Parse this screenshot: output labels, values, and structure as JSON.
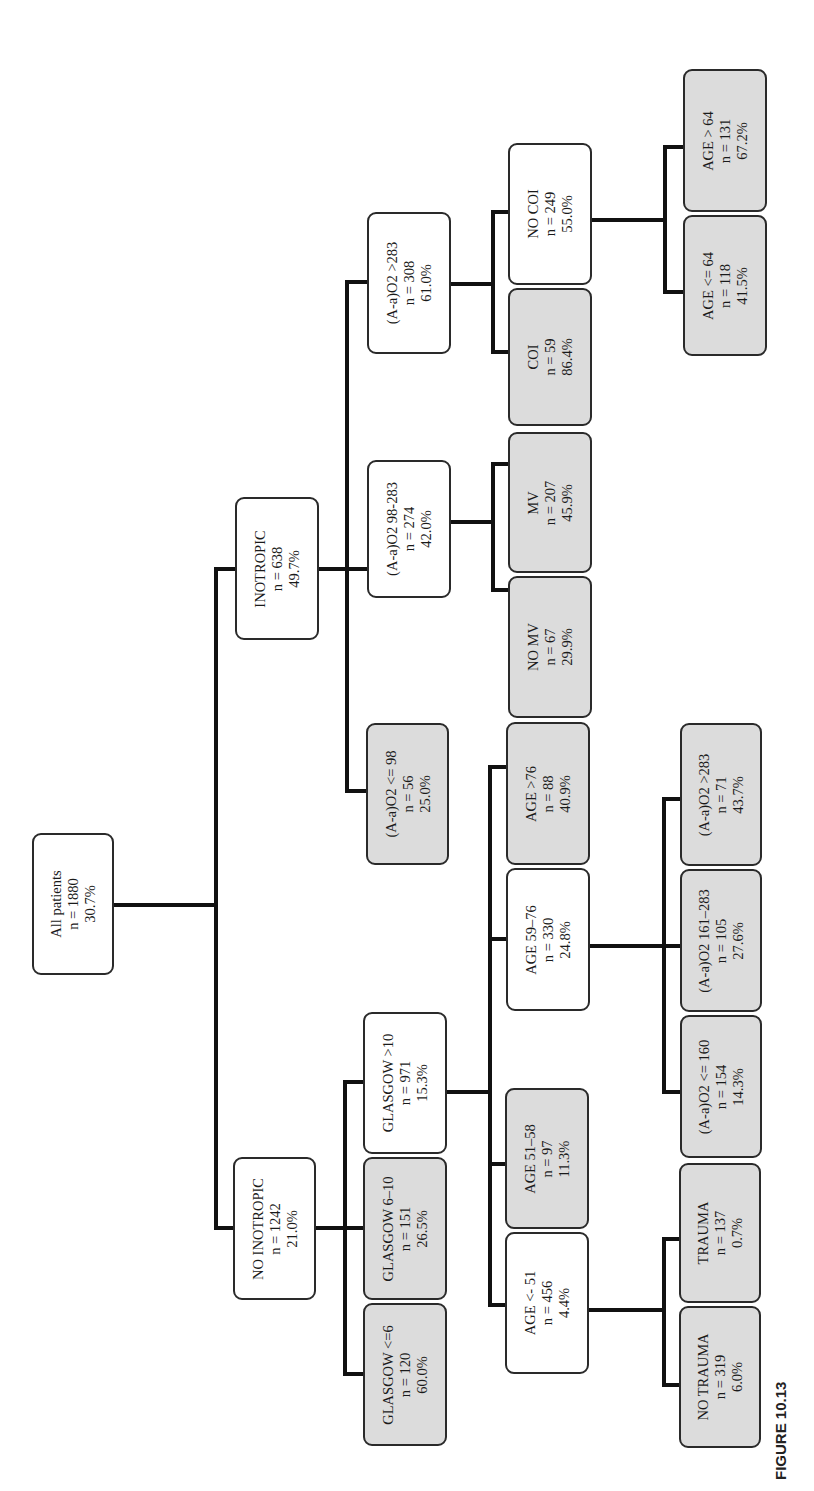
{
  "figure": {
    "label": "FIGURE 10.13",
    "orientation": "rotated 90deg counter-clockwise; root at left, leaves toward right"
  },
  "colors": {
    "internal_node_fill": "#ffffff",
    "leaf_node_fill": "#dcdcdc",
    "border": "#2a2a2a",
    "connector": "#111111"
  },
  "nodes": {
    "root": {
      "label": "All patients",
      "n": "n = 1880",
      "pct": "30.7%",
      "leaf": false
    },
    "inotropic": {
      "label": "INOTROPIC",
      "n": "n = 638",
      "pct": "49.7%",
      "leaf": false
    },
    "no_inotropic": {
      "label": "NO INOTROPIC",
      "n": "n = 1242",
      "pct": "21.0%",
      "leaf": false
    },
    "aao2_le98": {
      "label": "(A-a)O2 <= 98",
      "n": "n = 56",
      "pct": "25.0%",
      "leaf": true
    },
    "aao2_98_283": {
      "label": "(A-a)O2 98-283",
      "n": "n = 274",
      "pct": "42.0%",
      "leaf": false
    },
    "aao2_gt283": {
      "label": "(A-a)O2 >283",
      "n": "n = 308",
      "pct": "61.0%",
      "leaf": false
    },
    "no_mv": {
      "label": "NO MV",
      "n": "n = 67",
      "pct": "29.9%",
      "leaf": true
    },
    "mv": {
      "label": "MV",
      "n": "n = 207",
      "pct": "45.9%",
      "leaf": true
    },
    "coi": {
      "label": "COI",
      "n": "n = 59",
      "pct": "86.4%",
      "leaf": true
    },
    "no_coi": {
      "label": "NO COI",
      "n": "n = 249",
      "pct": "55.0%",
      "leaf": false
    },
    "age_le64": {
      "label": "AGE <= 64",
      "n": "n = 118",
      "pct": "41.5%",
      "leaf": true
    },
    "age_gt64": {
      "label": "AGE > 64",
      "n": "n = 131",
      "pct": "67.2%",
      "leaf": true
    },
    "glasgow_le6": {
      "label": "GLASGOW <=6",
      "n": "n = 120",
      "pct": "60.0%",
      "leaf": true
    },
    "glasgow_6_10": {
      "label": "GLASGOW 6–10",
      "n": "n = 151",
      "pct": "26.5%",
      "leaf": true
    },
    "glasgow_gt10": {
      "label": "GLASGOW >10",
      "n": "n = 971",
      "pct": "15.3%",
      "leaf": false
    },
    "age_le51": {
      "label": "AGE <- 51",
      "n": "n = 456",
      "pct": "4.4%",
      "leaf": false
    },
    "age_51_58": {
      "label": "AGE 51–58",
      "n": "n = 97",
      "pct": "11.3%",
      "leaf": true
    },
    "age_59_76": {
      "label": "AGE 59–76",
      "n": "n = 330",
      "pct": "24.8%",
      "leaf": false
    },
    "age_gt76": {
      "label": "AGE >76",
      "n": "n = 88",
      "pct": "40.9%",
      "leaf": true
    },
    "no_trauma": {
      "label": "NO TRAUMA",
      "n": "n = 319",
      "pct": "6.0%",
      "leaf": true
    },
    "trauma": {
      "label": "TRAUMA",
      "n": "n = 137",
      "pct": "0.7%",
      "leaf": true
    },
    "aao2_le160": {
      "label": "(A-a)O2 <= 160",
      "n": "n = 154",
      "pct": "14.3%",
      "leaf": true
    },
    "aao2_161_283": {
      "label": "(A-a)O2 161–283",
      "n": "n = 105",
      "pct": "27.6%",
      "leaf": true
    },
    "aao2_gt283_b": {
      "label": "(A-a)O2 >283",
      "n": "n = 71",
      "pct": "43.7%",
      "leaf": true
    }
  },
  "edges": [
    [
      "root",
      "inotropic"
    ],
    [
      "root",
      "no_inotropic"
    ],
    [
      "inotropic",
      "aao2_le98"
    ],
    [
      "inotropic",
      "aao2_98_283"
    ],
    [
      "inotropic",
      "aao2_gt283"
    ],
    [
      "aao2_98_283",
      "no_mv"
    ],
    [
      "aao2_98_283",
      "mv"
    ],
    [
      "aao2_gt283",
      "coi"
    ],
    [
      "aao2_gt283",
      "no_coi"
    ],
    [
      "no_coi",
      "age_le64"
    ],
    [
      "no_coi",
      "age_gt64"
    ],
    [
      "no_inotropic",
      "glasgow_le6"
    ],
    [
      "no_inotropic",
      "glasgow_6_10"
    ],
    [
      "no_inotropic",
      "glasgow_gt10"
    ],
    [
      "glasgow_gt10",
      "age_le51"
    ],
    [
      "glasgow_gt10",
      "age_51_58"
    ],
    [
      "glasgow_gt10",
      "age_59_76"
    ],
    [
      "glasgow_gt10",
      "age_gt76"
    ],
    [
      "age_le51",
      "no_trauma"
    ],
    [
      "age_le51",
      "trauma"
    ],
    [
      "age_59_76",
      "aao2_le160"
    ],
    [
      "age_59_76",
      "aao2_161_283"
    ],
    [
      "age_59_76",
      "aao2_gt283_b"
    ]
  ]
}
